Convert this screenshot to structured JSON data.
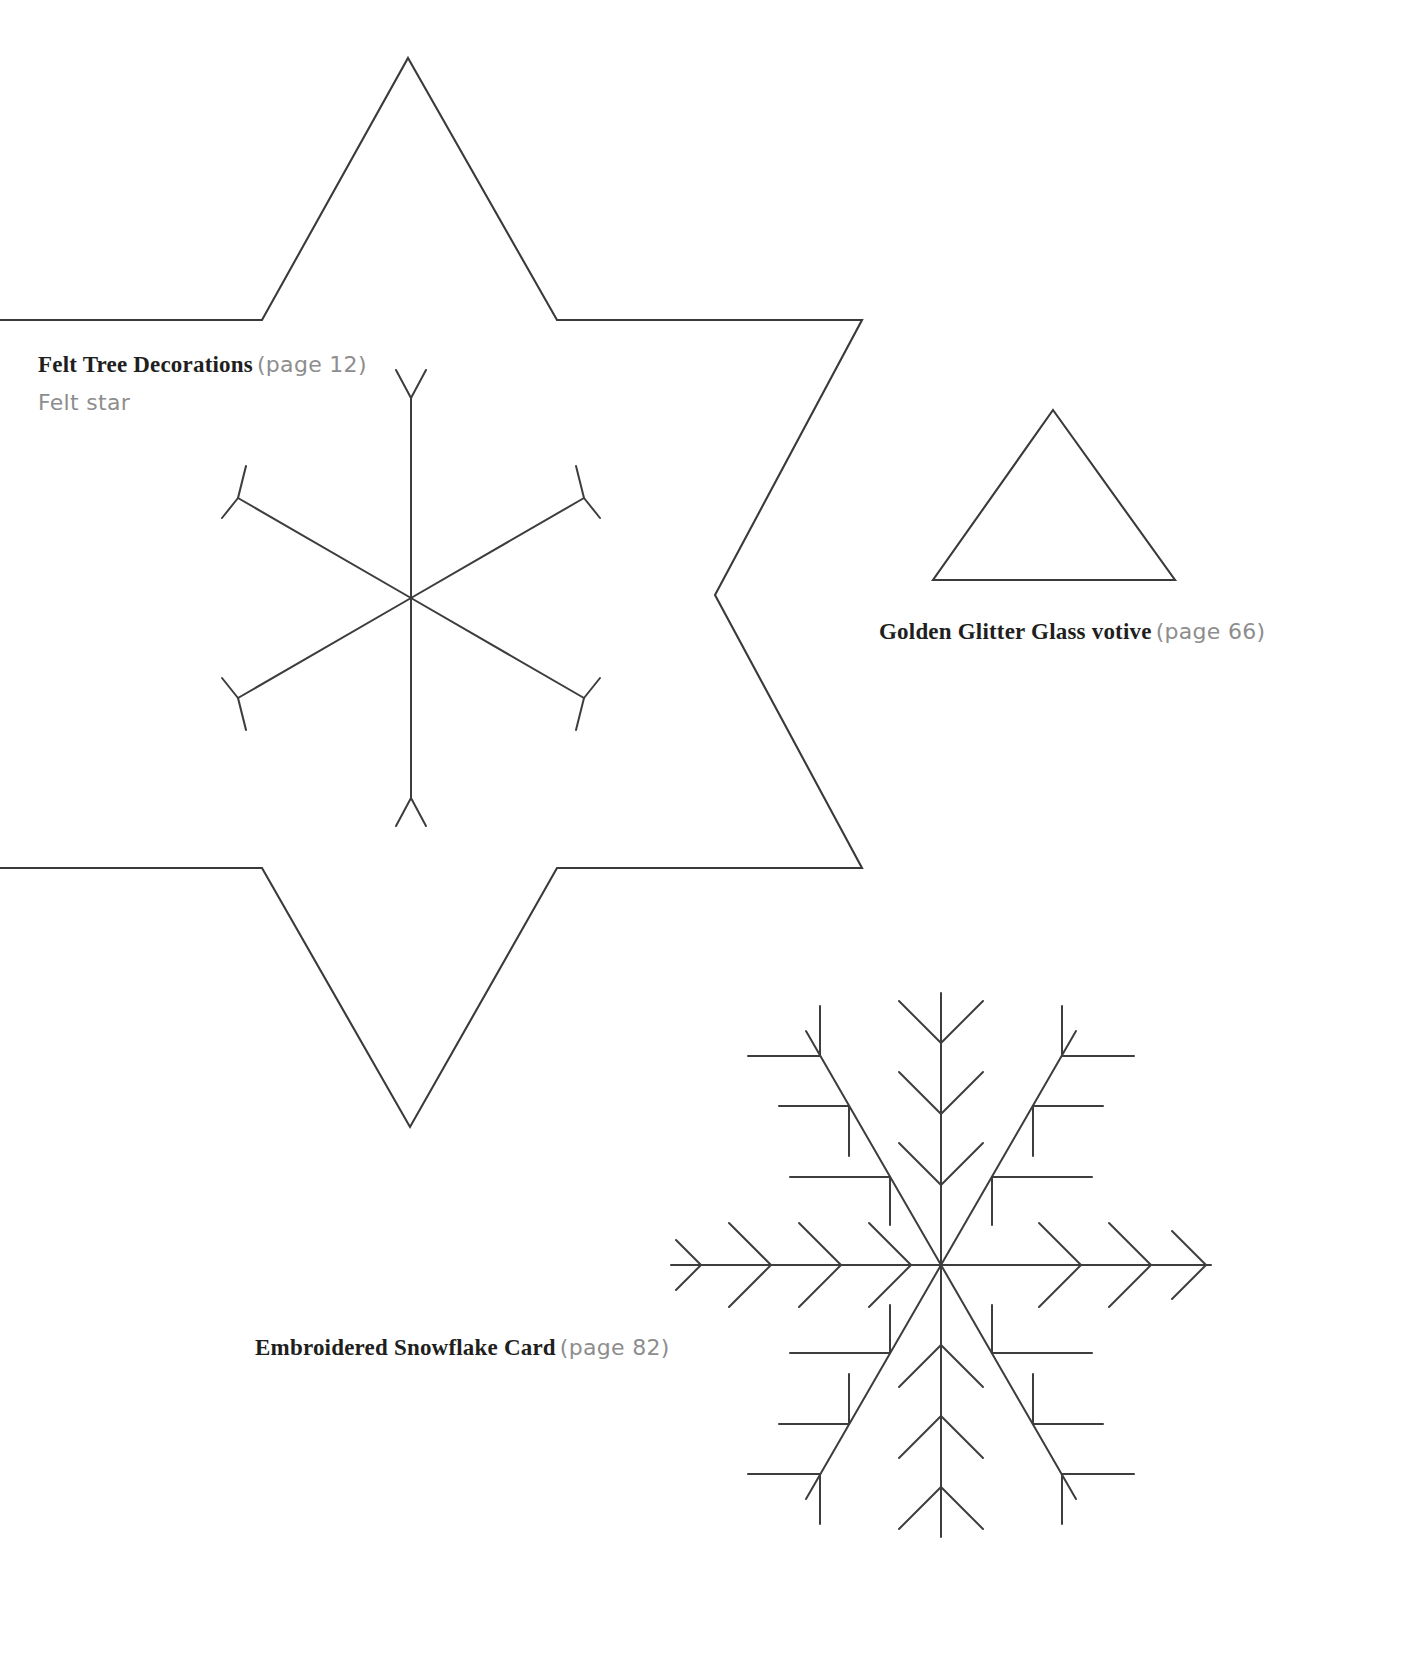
{
  "page": {
    "background_color": "#ffffff",
    "ink_color": "#3a3a3a",
    "text_color": "#211f1e",
    "muted_text_color": "#8d8d8d",
    "width": 1407,
    "height": 1657,
    "kind": "craft-template-sheet"
  },
  "labels": {
    "felt_tree": {
      "title": "Felt Tree Decorations",
      "page_ref": "(page 12)",
      "subtitle": "Felt star"
    },
    "votive": {
      "title": "Golden Glitter Glass votive",
      "page_ref": "(page 66)"
    },
    "snowflake_card": {
      "title": "Embroidered Snowflake Card",
      "page_ref": "(page 82)"
    }
  },
  "templates": [
    {
      "name": "felt-star-outline",
      "shape": "six-pointed-star",
      "description": "Large hexagram outline, cropped at left page edge",
      "center": [
        420,
        595
      ],
      "outer_radius": 540,
      "inner_radius": 300,
      "cropped_edge": "left"
    },
    {
      "name": "simple-snowflake",
      "shape": "six-arm-snowflake",
      "description": "Six straight arms with small V forks at each tip",
      "center": [
        411,
        598
      ],
      "arm_length": 200,
      "arm_count": 6,
      "tip_fork_length": 33,
      "tip_fork_angle_deg": 33
    },
    {
      "name": "votive-triangle",
      "shape": "triangle",
      "description": "Equilateral triangle template for glass votive",
      "apex": [
        1053,
        410
      ],
      "base_left": [
        933,
        580
      ],
      "base_right": [
        1175,
        580
      ]
    },
    {
      "name": "embroidered-snowflake",
      "shape": "six-arm-branching-snowflake",
      "description": "Six arms: vertical arms carry outward chevrons, horizontal arms carry chevrons, diagonal arms carry perpendicular T-bars",
      "center": [
        941,
        1265
      ],
      "arm_length": 270,
      "arm_count": 6
    }
  ]
}
